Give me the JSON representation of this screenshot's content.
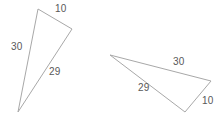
{
  "figure": {
    "type": "geometry-diagram",
    "background_color": "#ffffff",
    "stroke_color": "#a8a8a8",
    "label_color": "#585858",
    "width": 221,
    "height": 119,
    "triangles": [
      {
        "id": "left-triangle",
        "name": "triangle-1",
        "points": "38,9 72,29 18,112",
        "labels": [
          {
            "name": "side-label-10",
            "text": "10",
            "x": 55,
            "y": 3
          },
          {
            "name": "side-label-30",
            "text": "30",
            "x": 11,
            "y": 41
          },
          {
            "name": "side-label-29",
            "text": "29",
            "x": 49,
            "y": 66
          }
        ]
      },
      {
        "id": "right-triangle",
        "name": "triangle-2",
        "points": "110,55 211,81 185,112",
        "labels": [
          {
            "name": "side-label-30",
            "text": "30",
            "x": 173,
            "y": 56
          },
          {
            "name": "side-label-29",
            "text": "29",
            "x": 138,
            "y": 82
          },
          {
            "name": "side-label-10",
            "text": "10",
            "x": 202,
            "y": 95
          }
        ]
      }
    ]
  }
}
